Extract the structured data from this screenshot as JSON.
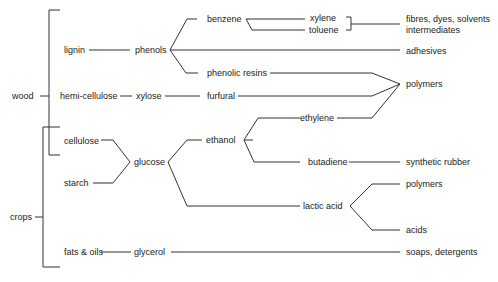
{
  "diagram": {
    "title": "",
    "line_color": "#333333",
    "text_color": "#222222",
    "sources": {
      "wood": "wood",
      "crops": "crops"
    },
    "feedstocks": {
      "lignin": "lignin",
      "hemicellulose": "hemi-cellulose",
      "cellulose": "cellulose",
      "starch": "starch",
      "fats_oils": "fats & oils"
    },
    "intermediates": {
      "phenols": "phenols",
      "xylose": "xylose",
      "glucose": "glucose",
      "glycerol": "glycerol",
      "benzene": "benzene",
      "phenolic_resins": "phenolic resins",
      "furfural": "furfural",
      "ethanol": "ethanol",
      "xylene": "xylene",
      "toluene": "toluene",
      "ethylene": "ethylene",
      "butadiene": "butadiene",
      "lactic_acid": "lactic acid"
    },
    "products": {
      "fibres": "fibres, dyes, solvents",
      "intermediates": "intermediates",
      "adhesives": "adhesives",
      "polymers_top": "polymers",
      "synthetic_rubber": "synthetic rubber",
      "polymers_bottom": "polymers",
      "acids": "acids",
      "soaps": "soaps, detergents"
    },
    "edges": [
      [
        "wood",
        "lignin"
      ],
      [
        "wood",
        "hemi-cellulose"
      ],
      [
        "wood",
        "cellulose"
      ],
      [
        "crops",
        "cellulose"
      ],
      [
        "crops",
        "starch"
      ],
      [
        "crops",
        "fats & oils"
      ],
      [
        "lignin",
        "phenols"
      ],
      [
        "hemi-cellulose",
        "xylose"
      ],
      [
        "cellulose",
        "glucose"
      ],
      [
        "starch",
        "glucose"
      ],
      [
        "fats & oils",
        "glycerol"
      ],
      [
        "phenols",
        "benzene"
      ],
      [
        "phenols",
        "adhesives"
      ],
      [
        "phenols",
        "phenolic resins"
      ],
      [
        "xylose",
        "furfural"
      ],
      [
        "glucose",
        "ethanol"
      ],
      [
        "glucose",
        "lactic acid"
      ],
      [
        "glycerol",
        "soaps, detergents"
      ],
      [
        "benzene",
        "xylene"
      ],
      [
        "benzene",
        "toluene"
      ],
      [
        "xylene",
        "fibres, dyes, solvents / intermediates"
      ],
      [
        "toluene",
        "fibres, dyes, solvents / intermediates"
      ],
      [
        "phenolic resins",
        "polymers"
      ],
      [
        "furfural",
        "polymers"
      ],
      [
        "ethylene",
        "polymers"
      ],
      [
        "ethanol",
        "ethylene"
      ],
      [
        "ethanol",
        "butadiene"
      ],
      [
        "butadiene",
        "synthetic rubber"
      ],
      [
        "lactic acid",
        "polymers"
      ],
      [
        "lactic acid",
        "acids"
      ]
    ]
  }
}
